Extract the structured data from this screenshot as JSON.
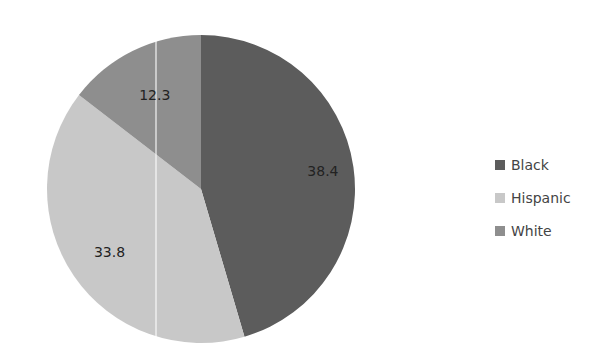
{
  "chart_data": {
    "type": "pie",
    "title": "",
    "categories": [
      "Black",
      "Hispanic",
      "White"
    ],
    "values": [
      38.4,
      33.8,
      12.3
    ],
    "colors": [
      "#5c5c5c",
      "#c8c8c8",
      "#8e8e8e"
    ],
    "data_labels": [
      "38.4",
      "33.8",
      "12.3"
    ],
    "start_angle_deg": 0,
    "direction": "clockwise",
    "legend_position": "right"
  },
  "legend": {
    "items": [
      {
        "label": "Black",
        "color": "#5c5c5c"
      },
      {
        "label": "Hispanic",
        "color": "#c8c8c8"
      },
      {
        "label": "White",
        "color": "#8e8e8e"
      }
    ]
  }
}
